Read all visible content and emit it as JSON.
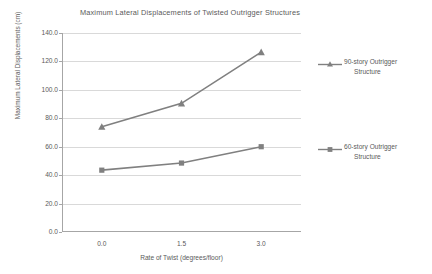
{
  "chart_data": {
    "type": "line",
    "title": "Maximum Lateral Displacements of Twisted Outrigger Structures",
    "xlabel": "Rate of Twist (degrees/floor)",
    "ylabel": "Maximum Lateral Displacements (cm)",
    "x": [
      0.0,
      1.5,
      3.0
    ],
    "categories": [
      "0.0",
      "1.5",
      "3.0"
    ],
    "xtick_labels": [
      "0.0",
      "1.5",
      "3.0"
    ],
    "ytick_labels": [
      "140.0",
      "120.0",
      "100.0",
      "80.0",
      "60.0",
      "40.0",
      "20.0",
      "0.0"
    ],
    "ytick_values": [
      140.0,
      120.0,
      100.0,
      80.0,
      60.0,
      40.0,
      20.0,
      0.0
    ],
    "ylim": [
      0.0,
      140.0
    ],
    "ytick_step": 20.0,
    "grid": "horizontal",
    "legend_position": "right",
    "series": [
      {
        "name": "90-story Outrigger Structure",
        "name_line1": "90-story Outrigger",
        "name_line2": "Structure",
        "marker": "triangle",
        "color": "#808080",
        "values": [
          74.0,
          90.5,
          126.5
        ]
      },
      {
        "name": "60-story Outrigger Structure",
        "name_line1": "60-story Outrigger",
        "name_line2": "Structure",
        "marker": "square",
        "color": "#808080",
        "values": [
          43.5,
          48.5,
          60.0
        ]
      }
    ]
  },
  "colors": {
    "background": "#ffffff",
    "text": "#5a5a5a",
    "gridline": "#d9d9d9",
    "axis": "#a6a6a6",
    "series": "#808080"
  }
}
